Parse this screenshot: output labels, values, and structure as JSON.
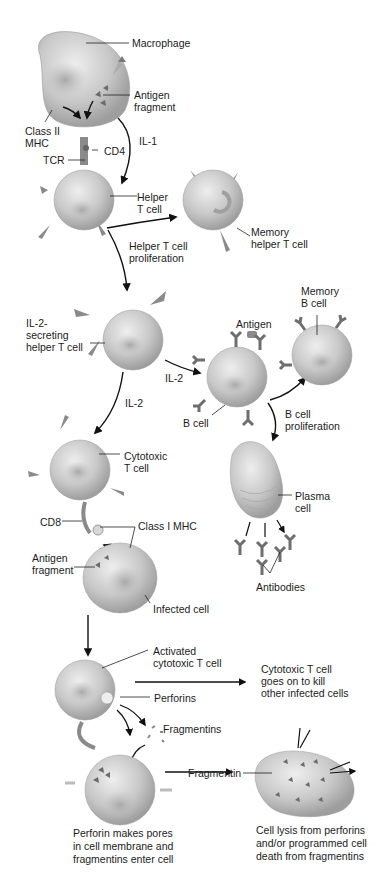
{
  "diagram": {
    "labels": {
      "macrophage": "Macrophage",
      "antigen_fragment_1": "Antigen\nfragment",
      "class_ii_mhc": "Class II\nMHC",
      "il1": "IL-1",
      "cd4": "CD4",
      "tcr": "TCR",
      "helper_t_cell": "Helper\nT cell",
      "memory_helper_t_cell": "Memory\nhelper T cell",
      "helper_t_proliferation": "Helper T cell\nproliferation",
      "il2_secreting_helper": "IL-2-\nsecreting\nhelper T cell",
      "antigen": "Antigen",
      "memory_b_cell": "Memory\nB cell",
      "il2_right": "IL-2",
      "il2_down": "IL-2",
      "b_cell": "B cell",
      "b_cell_proliferation": "B cell\nproliferation",
      "cytotoxic_t_cell": "Cytotoxic\nT cell",
      "plasma_cell": "Plasma\ncell",
      "cd8": "CD8",
      "class_i_mhc": "Class I MHC",
      "antigen_fragment_2": "Antigen\nfragment",
      "antibodies": "Antibodies",
      "infected_cell": "Infected cell",
      "activated_cytotoxic_t_cell": "Activated\ncytotoxic T cell",
      "cytotoxic_goes_on": "Cytotoxic T cell\ngoes on to kill\nother infected cells",
      "perforins": "Perforins",
      "fragmentins": "Fragmentins",
      "fragmentin": "Fragmentin",
      "caption_left": "Perforin makes pores\nin cell membrane and\nfragmentins enter cell",
      "caption_right": "Cell lysis from perforins\nand/or programmed cell\ndeath from fragmentins"
    },
    "colors": {
      "cell_fill": "#c9c9c9",
      "cell_shade": "#9a9a9a",
      "receptor": "#7a7a7a",
      "antigen": "#6a6a6a",
      "arrow": "#111111"
    }
  }
}
